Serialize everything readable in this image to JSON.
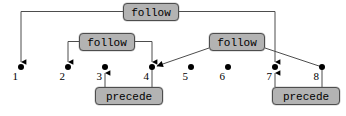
{
  "diagram": {
    "canvas": {
      "width": 346,
      "height": 116,
      "background": "#ffffff"
    },
    "colors": {
      "node_fill": "#b3b3b3",
      "node_border": "#4d4d4d",
      "edge": "#4d4d4d",
      "arrow": "#000000",
      "text": "#000000"
    },
    "nodes": [
      {
        "id": "follow-top",
        "label": "follow",
        "x": 123,
        "y": 3,
        "w": 56,
        "h": 18
      },
      {
        "id": "follow-left",
        "label": "follow",
        "x": 79,
        "y": 33,
        "w": 56,
        "h": 18
      },
      {
        "id": "follow-right",
        "label": "follow",
        "x": 209,
        "y": 33,
        "w": 56,
        "h": 18
      },
      {
        "id": "precede-left",
        "label": "precede",
        "x": 95,
        "y": 87,
        "w": 68,
        "h": 18
      },
      {
        "id": "precede-right",
        "label": "precede",
        "x": 272,
        "y": 87,
        "w": 68,
        "h": 18
      }
    ],
    "leaves": [
      {
        "num": "1",
        "x": 21,
        "y": 67
      },
      {
        "num": "2",
        "x": 68,
        "y": 67
      },
      {
        "num": "3",
        "x": 105,
        "y": 67
      },
      {
        "num": "4",
        "x": 152,
        "y": 67
      },
      {
        "num": "5",
        "x": 191,
        "y": 67
      },
      {
        "num": "6",
        "x": 228,
        "y": 67
      },
      {
        "num": "7",
        "x": 275,
        "y": 67
      },
      {
        "num": "8",
        "x": 322,
        "y": 67
      }
    ],
    "edges": [
      {
        "from": "follow-top",
        "to": "1",
        "kind": "elbow-down-arrow"
      },
      {
        "from": "follow-top",
        "to": "7",
        "kind": "elbow-down-arrow"
      },
      {
        "from": "follow-left",
        "to": "2",
        "kind": "elbow-down-arrow"
      },
      {
        "from": "follow-left",
        "to": "4",
        "kind": "elbow-down-arrow"
      },
      {
        "from": "follow-right",
        "to": "4",
        "kind": "diagonal-arrow"
      },
      {
        "from": "follow-right",
        "to": "8",
        "kind": "diagonal-plain"
      },
      {
        "from": "precede-left",
        "to": "3",
        "kind": "vertical-up-arrow"
      },
      {
        "from": "precede-left",
        "to": "4",
        "kind": "vertical-plain"
      },
      {
        "from": "precede-right",
        "to": "7",
        "kind": "vertical-up-arrow"
      },
      {
        "from": "precede-right",
        "to": "8",
        "kind": "vertical-plain"
      }
    ]
  }
}
